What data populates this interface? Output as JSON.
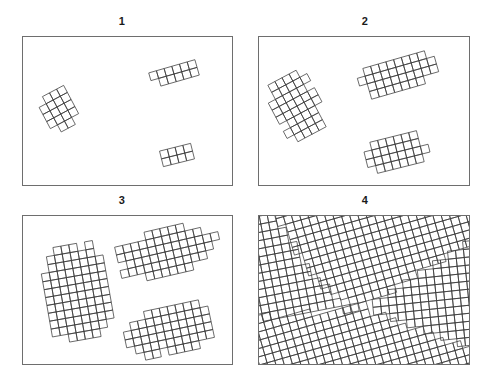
{
  "figure": {
    "title": "",
    "background_color": "#ffffff",
    "line_color": "#3a3a3a",
    "frame_color": "#6e6e6e",
    "label_color": "#1a1a1a",
    "width": 485,
    "height": 383
  },
  "panels": [
    {
      "label": "1",
      "label_x": 102,
      "label_y": 15,
      "frame_x": 22,
      "frame_y": 36,
      "frame_w": 211,
      "frame_h": 150,
      "stage": 1,
      "grains": [
        {
          "name": "grain-a",
          "cx": 57,
          "cy": 107,
          "angle": -28,
          "cell": 8.0,
          "radius_x": 15,
          "radius_y": 22,
          "roughness": 0.42,
          "seed": 11
        },
        {
          "name": "grain-b",
          "cx": 174,
          "cy": 74,
          "angle": -16,
          "cell": 8.0,
          "radius_x": 24,
          "radius_y": 12,
          "roughness": 0.4,
          "seed": 23
        },
        {
          "name": "grain-c",
          "cx": 177,
          "cy": 155,
          "angle": -14,
          "cell": 8.0,
          "radius_x": 18,
          "radius_y": 9,
          "roughness": 0.38,
          "seed": 37
        }
      ]
    },
    {
      "label": "2",
      "label_x": 345,
      "label_y": 15,
      "frame_x": 258,
      "frame_y": 36,
      "frame_w": 212,
      "frame_h": 150,
      "stage": 2,
      "grains": [
        {
          "name": "grain-a",
          "cx": 297,
          "cy": 106,
          "angle": -28,
          "cell": 8.0,
          "radius_x": 23,
          "radius_y": 36,
          "roughness": 0.4,
          "seed": 11
        },
        {
          "name": "grain-b",
          "cx": 398,
          "cy": 75,
          "angle": -16,
          "cell": 8.0,
          "radius_x": 40,
          "radius_y": 20,
          "roughness": 0.38,
          "seed": 23
        },
        {
          "name": "grain-c",
          "cx": 397,
          "cy": 152,
          "angle": -14,
          "cell": 8.0,
          "radius_x": 35,
          "radius_y": 17,
          "roughness": 0.36,
          "seed": 37
        }
      ]
    },
    {
      "label": "3",
      "label_x": 102,
      "label_y": 194,
      "frame_x": 22,
      "frame_y": 215,
      "frame_w": 211,
      "frame_h": 150,
      "stage": 3,
      "grains": [
        {
          "name": "grain-a",
          "cx": 77,
          "cy": 292,
          "angle": -10,
          "cell": 8.0,
          "radius_x": 38,
          "radius_y": 54,
          "roughness": 0.3,
          "seed": 11
        },
        {
          "name": "grain-b",
          "cx": 165,
          "cy": 252,
          "angle": -13,
          "cell": 8.0,
          "radius_x": 52,
          "radius_y": 26,
          "roughness": 0.3,
          "seed": 23
        },
        {
          "name": "grain-c",
          "cx": 172,
          "cy": 330,
          "angle": -12,
          "cell": 8.0,
          "radius_x": 50,
          "radius_y": 25,
          "roughness": 0.28,
          "seed": 37
        }
      ]
    },
    {
      "label": "4",
      "label_x": 345,
      "label_y": 194,
      "frame_x": 258,
      "frame_y": 215,
      "frame_w": 212,
      "frame_h": 150,
      "stage": 4,
      "impinged": true,
      "grains": [
        {
          "name": "grain-a",
          "cx": 298,
          "cy": 283,
          "angle": -6,
          "cell": 8.0,
          "seed": 11
        },
        {
          "name": "grain-b",
          "cx": 405,
          "cy": 253,
          "angle": -11,
          "cell": 8.0,
          "seed": 23
        },
        {
          "name": "grain-c",
          "cx": 400,
          "cy": 333,
          "angle": -16,
          "cell": 8.0,
          "seed": 37
        }
      ],
      "boundaries": [
        {
          "name": "boundary-a-b",
          "points": [
            [
              268,
              215
            ],
            [
              272,
              216
            ],
            [
              282,
              225
            ],
            [
              292,
              243
            ],
            [
              300,
              256
            ],
            [
              308,
              268
            ],
            [
              318,
              280
            ],
            [
              332,
              294
            ],
            [
              346,
              302
            ],
            [
              362,
              308
            ]
          ]
        },
        {
          "name": "boundary-a-c",
          "points": [
            [
              362,
              308
            ],
            [
              352,
              314
            ],
            [
              342,
              324
            ],
            [
              332,
              338
            ],
            [
              322,
              352
            ],
            [
              314,
              365
            ]
          ]
        },
        {
          "name": "boundary-b-c",
          "points": [
            [
              362,
              308
            ],
            [
              384,
              306
            ],
            [
              408,
              303
            ],
            [
              432,
              301
            ],
            [
              452,
              300
            ],
            [
              470,
              300
            ]
          ]
        }
      ]
    }
  ]
}
